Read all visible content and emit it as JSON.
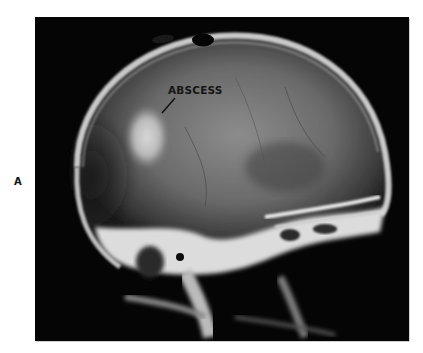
{
  "figure": {
    "panel_label": "A",
    "image_description": "Lateral skull radiograph",
    "annotations": [
      {
        "text": "ABSCESS",
        "pointer": true
      }
    ]
  },
  "colors": {
    "background": "#ffffff",
    "film_background": "#050505",
    "label_text": "#111111"
  }
}
